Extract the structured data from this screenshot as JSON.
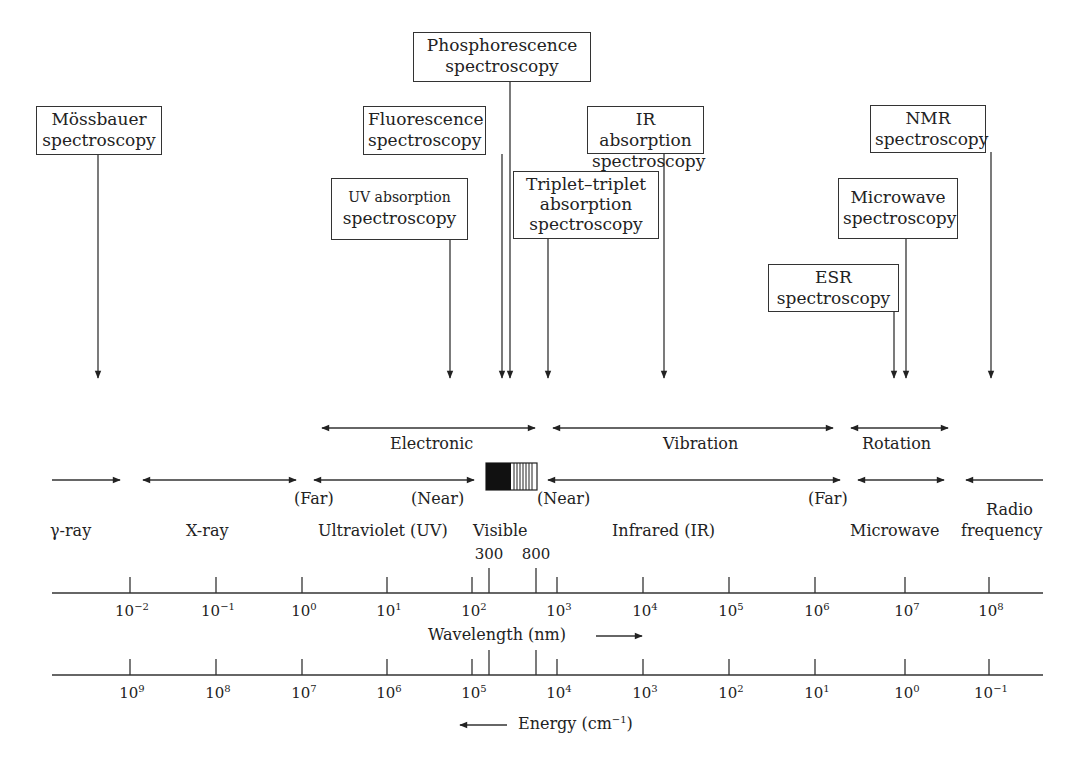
{
  "techniques": {
    "phosphorescence": {
      "line1": "Phosphorescence",
      "line2": "spectroscopy"
    },
    "mossbauer": {
      "line1": "Mössbauer",
      "line2": "spectroscopy"
    },
    "fluorescence": {
      "line1": "Fluorescence",
      "line2": "spectroscopy"
    },
    "uv_absorption": {
      "line1": "UV absorption",
      "line2": "spectroscopy"
    },
    "triplet": {
      "line1": "Triplet–triplet",
      "line2": "absorption",
      "line3": "spectroscopy"
    },
    "ir_absorption": {
      "line1": "IR absorption",
      "line2": "spectroscopy"
    },
    "nmr": {
      "line1": "NMR",
      "line2": "spectroscopy"
    },
    "microwave_spec": {
      "line1": "Microwave",
      "line2": "spectroscopy"
    },
    "esr": {
      "line1": "ESR",
      "line2": "spectroscopy"
    }
  },
  "transitions": {
    "electronic": "Electronic",
    "vibration": "Vibration",
    "rotation": "Rotation"
  },
  "regions": {
    "gamma": "γ-ray",
    "xray": "X-ray",
    "uv": "Ultraviolet (UV)",
    "visible": "Visible",
    "ir": "Infrared (IR)",
    "microwave": "Microwave",
    "radio_line1": "Radio",
    "radio_line2": "frequency",
    "uv_far": "(Far)",
    "uv_near": "(Near)",
    "ir_near": "(Near)",
    "ir_far": "(Far)"
  },
  "visible_bounds": {
    "low": "300",
    "high": "800"
  },
  "wavelength_axis": {
    "label": "Wavelength (nm)",
    "ticks": [
      {
        "base": "10",
        "exp": "−2"
      },
      {
        "base": "10",
        "exp": "−1"
      },
      {
        "base": "10",
        "exp": "0"
      },
      {
        "base": "10",
        "exp": "1"
      },
      {
        "base": "10",
        "exp": "2"
      },
      {
        "base": "10",
        "exp": "3"
      },
      {
        "base": "10",
        "exp": "4"
      },
      {
        "base": "10",
        "exp": "5"
      },
      {
        "base": "10",
        "exp": "6"
      },
      {
        "base": "10",
        "exp": "7"
      },
      {
        "base": "10",
        "exp": "8"
      }
    ]
  },
  "energy_axis": {
    "label_prefix": "Energy (cm",
    "label_exp": "−1",
    "label_suffix": ")",
    "ticks": [
      {
        "base": "10",
        "exp": "9"
      },
      {
        "base": "10",
        "exp": "8"
      },
      {
        "base": "10",
        "exp": "7"
      },
      {
        "base": "10",
        "exp": "6"
      },
      {
        "base": "10",
        "exp": "5"
      },
      {
        "base": "10",
        "exp": "4"
      },
      {
        "base": "10",
        "exp": "3"
      },
      {
        "base": "10",
        "exp": "2"
      },
      {
        "base": "10",
        "exp": "1"
      },
      {
        "base": "10",
        "exp": "0"
      },
      {
        "base": "10",
        "exp": "−1"
      }
    ]
  }
}
